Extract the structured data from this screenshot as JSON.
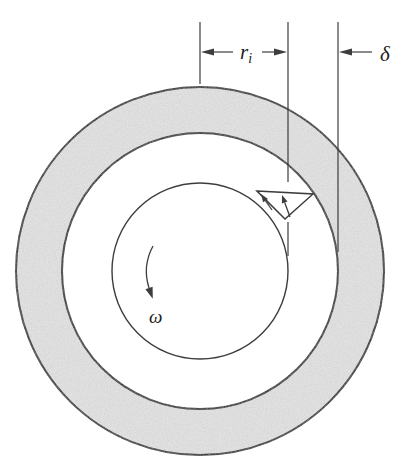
{
  "figure": {
    "labels": {
      "inner_radius": {
        "symbol": "r",
        "subscript": "i"
      },
      "gap": "δ",
      "angular_velocity": "ω"
    },
    "colors": {
      "outer_ring_fill": "#e3e3e3",
      "ink": "#3d3d3d",
      "background": "#ffffff"
    }
  }
}
